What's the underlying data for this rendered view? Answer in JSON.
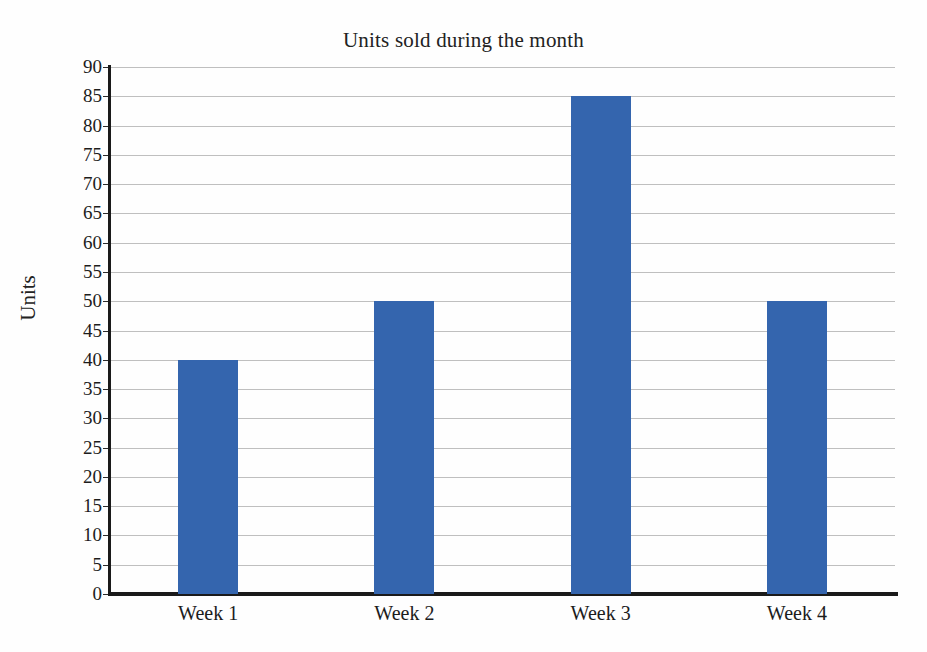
{
  "chart_data": {
    "type": "bar",
    "title": "Units sold during the month",
    "xlabel": "",
    "ylabel": "Units",
    "categories": [
      "Week 1",
      "Week 2",
      "Week 3",
      "Week 4"
    ],
    "values": [
      40,
      50,
      85,
      50
    ],
    "series": [
      {
        "name": "Units",
        "values": [
          40,
          50,
          85,
          50
        ]
      }
    ],
    "ylim": [
      0,
      90
    ],
    "ytick_step": 5,
    "yticks": [
      0,
      5,
      10,
      15,
      20,
      25,
      30,
      35,
      40,
      45,
      50,
      55,
      60,
      65,
      70,
      75,
      80,
      85,
      90
    ],
    "ytick_labels": [
      "0",
      "5",
      "10",
      "15",
      "20",
      "25",
      "30",
      "35",
      "40",
      "45",
      "50",
      "55",
      "60",
      "65",
      "70",
      "75",
      "80",
      "85",
      "90"
    ],
    "grid": true,
    "grid_axis": "y",
    "legend": false,
    "legend_position": "none",
    "bar_color": "#3465ae",
    "gridline_color": "#bfbfbf",
    "axis_color": "#1a1a1a",
    "background_color": "#fefefe"
  }
}
